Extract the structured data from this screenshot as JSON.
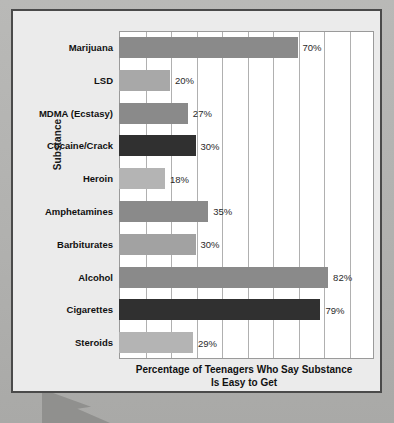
{
  "chart_data": {
    "type": "bar",
    "orientation": "horizontal",
    "title": "",
    "xlabel_line1": "Percentage of Teenagers Who Say Substance",
    "xlabel_line2": "Is Easy to Get",
    "ylabel": "Substance",
    "xlim": [
      0,
      100
    ],
    "xtick_step": 10,
    "grid": true,
    "grid_axis": "x",
    "legend": "none",
    "categories": [
      "Marijuana",
      "LSD",
      "MDMA (Ecstasy)",
      "Cocaine/Crack",
      "Heroin",
      "Amphetamines",
      "Barbiturates",
      "Alcohol",
      "Cigarettes",
      "Steroids"
    ],
    "values": [
      70,
      20,
      27,
      30,
      18,
      35,
      30,
      82,
      79,
      29
    ],
    "value_labels": [
      "70%",
      "20%",
      "27%",
      "30%",
      "18%",
      "35%",
      "30%",
      "82%",
      "79%",
      "29%"
    ],
    "bar_colors": [
      "#8a8a8a",
      "#a8a8a8",
      "#8a8a8a",
      "#303030",
      "#b4b4b4",
      "#8a8a8a",
      "#a2a2a2",
      "#8a8a8a",
      "#303030",
      "#b4b4b4"
    ],
    "bar_textured": [
      false,
      true,
      false,
      false,
      false,
      false,
      true,
      false,
      false,
      false
    ]
  },
  "style": {
    "frame_border_color": "#4a4a4a",
    "panel_background": "#ebebeb",
    "plot_background": "#ffffff",
    "gridline_color": "#b0b0b0",
    "page_background": "#b3b3b3"
  }
}
